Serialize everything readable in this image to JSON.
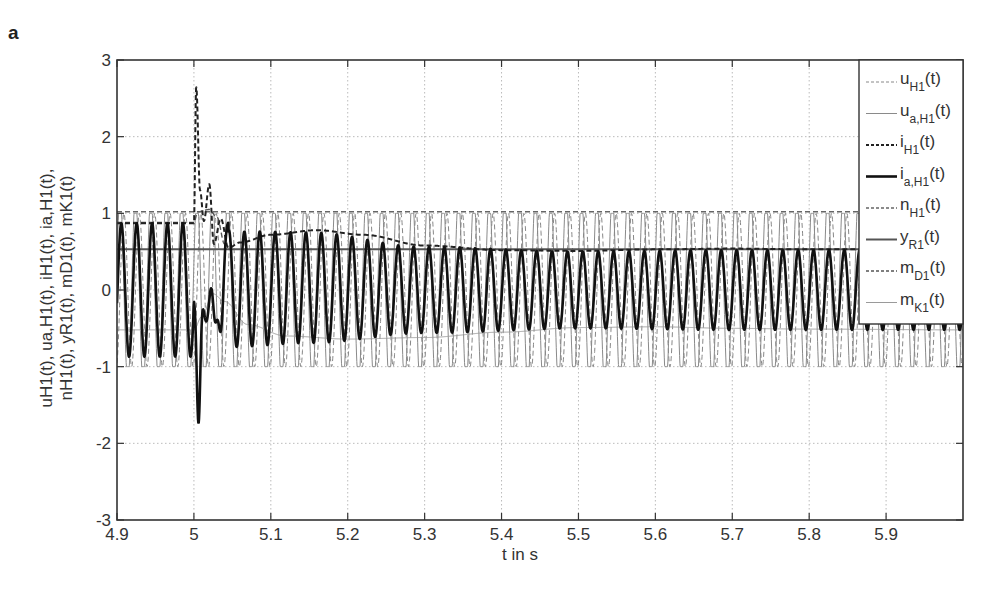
{
  "panel_label": "a",
  "chart_data": {
    "type": "line",
    "title": "",
    "xlabel": "t in s",
    "ylabel_lines": [
      "u_H1(t), u_a,H1(t), i_H1(t), i_a,H1(t),",
      "n_H1(t), y_R1(t), m_D1(t), m_K1(t)"
    ],
    "xlim": [
      4.9,
      6.0
    ],
    "ylim": [
      -3,
      3
    ],
    "xticks": [
      4.9,
      5.0,
      5.1,
      5.2,
      5.3,
      5.4,
      5.5,
      5.6,
      5.7,
      5.8,
      5.9
    ],
    "xtick_labels": [
      "4.9",
      "5",
      "5.1",
      "5.2",
      "5.3",
      "5.4",
      "5.5",
      "5.6",
      "5.7",
      "5.8",
      "5.9"
    ],
    "yticks": [
      3,
      2,
      1,
      0,
      -1,
      -2,
      -3
    ],
    "ytick_labels": [
      "3",
      "2",
      "1",
      "0",
      "-1",
      "-2",
      "-3"
    ],
    "grid": true,
    "legend_position": "upper right (inside)",
    "event_time": 5.0,
    "frequency_hz": 50,
    "series": [
      {
        "name": "u_H1(t)",
        "label_main": "u",
        "label_sub": "H1",
        "style": "dashed",
        "color": "#888888",
        "width": 1.0,
        "description": "supply voltage, amplitude 1, 50 Hz",
        "amplitude": 1.0
      },
      {
        "name": "u_a,H1(t)",
        "label_main": "u",
        "label_sub": "a,H1",
        "style": "solid",
        "color": "#8a8a8a",
        "width": 1.0,
        "description": "output voltage, near-square 50 Hz, ±1.02",
        "amplitude": 1.02
      },
      {
        "name": "i_H1(t)",
        "label_main": "i",
        "label_sub": "H1",
        "style": "dashed",
        "color": "#222222",
        "width": 2.0,
        "description": "current envelope: 0.87 before 5.0, peak 2.65 at 5.003, 1.38 at 5.02, rises to 0.78 at 5.16, settles 0.53",
        "points": [
          [
            4.9,
            0.87
          ],
          [
            5.0,
            0.87
          ],
          [
            5.003,
            2.65
          ],
          [
            5.008,
            1.3
          ],
          [
            5.013,
            0.9
          ],
          [
            5.02,
            1.38
          ],
          [
            5.026,
            0.6
          ],
          [
            5.035,
            0.93
          ],
          [
            5.045,
            0.55
          ],
          [
            5.06,
            0.62
          ],
          [
            5.1,
            0.72
          ],
          [
            5.16,
            0.78
          ],
          [
            5.22,
            0.72
          ],
          [
            5.3,
            0.58
          ],
          [
            5.4,
            0.52
          ],
          [
            5.5,
            0.51
          ],
          [
            5.6,
            0.53
          ],
          [
            5.7,
            0.54
          ],
          [
            5.8,
            0.53
          ],
          [
            5.9,
            0.53
          ],
          [
            6.0,
            0.53
          ]
        ]
      },
      {
        "name": "i_a,H1(t)",
        "label_main": "i",
        "label_sub": "a,H1",
        "style": "solid",
        "color": "#111111",
        "width": 2.6,
        "description": "armature current, sinusoid amplitude 0.87 before event, dip to -2.65 at 5.005, then amplitude ~0.6 decaying to 0.52",
        "amp_points": [
          [
            4.9,
            0.87
          ],
          [
            5.0,
            0.87
          ],
          [
            5.06,
            0.75
          ],
          [
            5.15,
            0.72
          ],
          [
            5.3,
            0.56
          ],
          [
            5.5,
            0.5
          ],
          [
            5.7,
            0.52
          ],
          [
            6.0,
            0.52
          ]
        ],
        "offset_points": [
          [
            4.9,
            0.0
          ],
          [
            5.0,
            0.0
          ],
          [
            5.15,
            0.03
          ],
          [
            5.3,
            0.0
          ],
          [
            6.0,
            0.0
          ]
        ]
      },
      {
        "name": "n_H1(t)",
        "label_main": "n",
        "label_sub": "H1",
        "style": "dashed",
        "color": "#666666",
        "width": 1.4,
        "description": "speed, constant ~1.02",
        "value": 1.02
      },
      {
        "name": "y_R1(t)",
        "label_main": "y",
        "label_sub": "R1",
        "style": "solid",
        "color": "#555555",
        "width": 2.0,
        "description": "controller output, constant ~0.53",
        "value": 0.53
      },
      {
        "name": "m_D1(t)",
        "label_main": "m",
        "label_sub": "D1",
        "style": "dashed",
        "color": "#555555",
        "width": 1.4,
        "description": "torque D1, ~0.9 before event, spikes to ~1.05 then tracks i_H1 envelope",
        "points": [
          [
            4.9,
            0.88
          ],
          [
            5.0,
            0.88
          ],
          [
            5.005,
            1.02
          ],
          [
            5.02,
            1.05
          ],
          [
            5.03,
            0.95
          ],
          [
            5.04,
            0.6
          ]
        ]
      },
      {
        "name": "m_K1(t)",
        "label_main": "m",
        "label_sub": "K1",
        "style": "solid",
        "color": "#9a9a9a",
        "width": 1.0,
        "description": "torque K1, -0.52 before, rises to ~0 at 5.03, drops to ~-0.63 around 5.2, settles -0.5",
        "points": [
          [
            4.9,
            -0.52
          ],
          [
            5.0,
            -0.52
          ],
          [
            5.01,
            -0.35
          ],
          [
            5.025,
            -0.05
          ],
          [
            5.04,
            -0.15
          ],
          [
            5.07,
            -0.45
          ],
          [
            5.12,
            -0.6
          ],
          [
            5.2,
            -0.64
          ],
          [
            5.3,
            -0.62
          ],
          [
            5.4,
            -0.55
          ],
          [
            5.5,
            -0.49
          ],
          [
            5.6,
            -0.48
          ],
          [
            5.7,
            -0.5
          ],
          [
            5.8,
            -0.51
          ],
          [
            6.0,
            -0.52
          ]
        ]
      }
    ]
  }
}
